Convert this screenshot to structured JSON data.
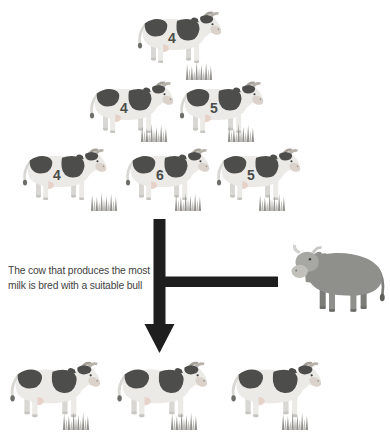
{
  "colors": {
    "background": "#ffffff",
    "cow_body": "#ebeae6",
    "cow_shade": "#d8d7d3",
    "cow_patch": "#4d4d4b",
    "cow_muzzle": "#dbd2cb",
    "grass_dark": "#94938f",
    "grass_light": "#bdbcb8",
    "bull_body": "#8f8f8c",
    "bull_head": "#a7a7a3",
    "bull_muzzle": "#c1c0bb",
    "arrow": "#1e1e1e",
    "caption_text": "#3f3f3f",
    "number_text": "#4c4c4a"
  },
  "caption": {
    "line1": "The cow that produces the most",
    "line2": "milk is bred with a suitable bull"
  },
  "herd": {
    "row1": [
      "4"
    ],
    "row2": [
      "4",
      "5"
    ],
    "row3": [
      "4",
      "6",
      "5"
    ]
  },
  "offspring_count": 3
}
